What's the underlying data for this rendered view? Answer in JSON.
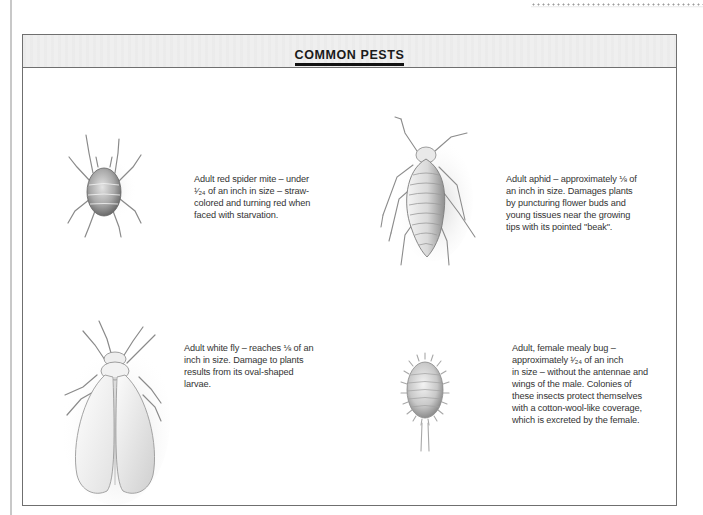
{
  "page": {
    "title": "COMMON PESTS"
  },
  "pests": [
    {
      "name": "red spider mite",
      "icon": "spider-mite-illustration",
      "description": "Adult red spider mite – under ¹⁄₂₄ of an inch in size – straw-colored and turning red when faced with starvation.",
      "lines": [
        "Adult red spider mite – under",
        "¹⁄₂₄ of an inch in size – straw-",
        "colored and turning red when",
        "faced with starvation."
      ]
    },
    {
      "name": "aphid",
      "icon": "aphid-illustration",
      "description": "Adult aphid – approximately ⅛ of an inch in size. Damages plants by puncturing flower buds and young tissues near the growing tips with its pointed \"beak\".",
      "lines": [
        "Adult aphid – approximately ⅛ of",
        "an inch in size. Damages plants",
        "by puncturing flower buds and",
        "young tissues near the growing",
        "tips with its pointed \"beak\"."
      ]
    },
    {
      "name": "white fly",
      "icon": "white-fly-illustration",
      "description": "Adult white fly – reaches ⅛ of an inch in size. Damage to plants results from its oval-shaped larvae.",
      "lines": [
        "Adult white fly – reaches ⅛ of an",
        "inch in size. Damage to plants",
        "results from its oval-shaped",
        "larvae."
      ]
    },
    {
      "name": "mealy bug",
      "icon": "mealy-bug-illustration",
      "description": "Adult, female mealy bug – approximately ¹⁄₂₄ of an inch in size – without the antennae and wings of the male. Colonies of these insects protect themselves with a cotton-wool-like coverage, which is excreted by the female.",
      "lines": [
        "Adult, female mealy bug –",
        "approximately ¹⁄₂₄ of an inch",
        "in size – without the antennae and",
        "wings of the male. Colonies of",
        "these insects protect themselves",
        "with a cotton-wool-like coverage,",
        "which is excreted by the female."
      ]
    }
  ],
  "colors": {
    "frame": "#6f6f6f",
    "header_band": "#efefef",
    "title": "#1a1a1a",
    "body_text": "#333333"
  }
}
